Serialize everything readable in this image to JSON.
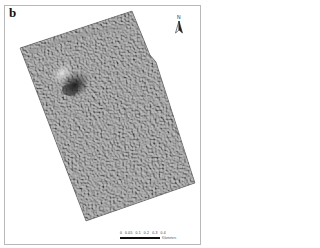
{
  "figure": {
    "panel_label": "b",
    "type": "shaded relief map",
    "colors": {
      "background": "#ffffff",
      "frame_border": "#b8b8b8",
      "relief_base": "#5e5e5e",
      "relief_highlight": "#d8d8d8",
      "relief_shadow": "#1e1e1e"
    }
  },
  "north_arrow": {
    "label": "N",
    "icon": "north-arrow-icon"
  },
  "scale_bar": {
    "ticks": [
      "0",
      "0.05",
      "0.1",
      "0.2",
      "0.3",
      "0.4"
    ],
    "unit": "Kilometers"
  }
}
